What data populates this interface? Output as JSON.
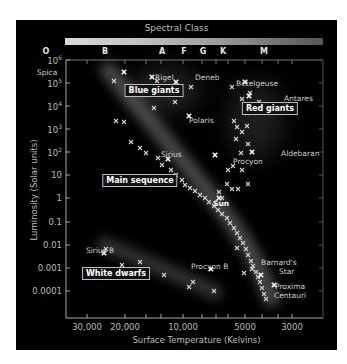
{
  "chart_data": {
    "type": "scatter",
    "title": "Spectral Class",
    "xlabel": "Surface Temperature (Kelvins)",
    "ylabel": "Luminosity (Solar units)",
    "x_scale": "log (reversed)",
    "y_scale": "log",
    "spectral_classes": [
      "O",
      "B",
      "A",
      "F",
      "G",
      "K",
      "M"
    ],
    "x_ticks": [
      "30,000",
      "20,000",
      "10,000",
      "5000",
      "3000"
    ],
    "y_ticks": [
      "10^6",
      "10^5",
      "10^4",
      "10^3",
      "10^2",
      "10",
      "1",
      "0.1",
      "0.01",
      "0.001",
      "0.0001"
    ],
    "regions": [
      "Blue giants",
      "Red giants",
      "Main sequence",
      "White dwarfs"
    ],
    "labeled_stars": [
      {
        "name": "Spica",
        "temp_K": 22000,
        "luminosity": 12000
      },
      {
        "name": "Rigel",
        "temp_K": 11000,
        "luminosity": 80000
      },
      {
        "name": "Deneb",
        "temp_K": 9000,
        "luminosity": 60000
      },
      {
        "name": "Polaris",
        "temp_K": 6500,
        "luminosity": 2000
      },
      {
        "name": "Betelgeuse",
        "temp_K": 3300,
        "luminosity": 100000
      },
      {
        "name": "Antares",
        "temp_K": 3100,
        "luminosity": 30000
      },
      {
        "name": "Aldebaran",
        "temp_K": 4000,
        "luminosity": 120
      },
      {
        "name": "Sirius",
        "temp_K": 10000,
        "luminosity": 25
      },
      {
        "name": "Procyon",
        "temp_K": 6500,
        "luminosity": 7
      },
      {
        "name": "Sun",
        "temp_K": 5800,
        "luminosity": 1
      },
      {
        "name": "Sirius B",
        "temp_K": 21000,
        "luminosity": 0.003
      },
      {
        "name": "Procyon B",
        "temp_K": 7500,
        "luminosity": 0.0006
      },
      {
        "name": "Barnard's Star",
        "temp_K": 3100,
        "luminosity": 0.0005
      },
      {
        "name": "Proxima Centauri",
        "temp_K": 2900,
        "luminosity": 0.0001
      }
    ],
    "grid": false,
    "legend": "none"
  },
  "header": {
    "title": "Spectral Class"
  },
  "axes": {
    "xlabel": "Surface Temperature (Kelvins)",
    "ylabel": "Luminosity (Solar units)",
    "y_ticks": [
      {
        "label": "10",
        "sup": "6",
        "y": 40
      },
      {
        "label": "10",
        "sup": "5",
        "y": 63
      },
      {
        "label": "10",
        "sup": "4",
        "y": 86
      },
      {
        "label": "10",
        "sup": "3",
        "y": 109
      },
      {
        "label": "10",
        "sup": "2",
        "y": 132
      },
      {
        "label": "10",
        "sup": "",
        "y": 155
      },
      {
        "label": "1",
        "sup": "",
        "y": 178
      },
      {
        "label": "0.1",
        "sup": "",
        "y": 202
      },
      {
        "label": "0.01",
        "sup": "",
        "y": 225
      },
      {
        "label": "0.001",
        "sup": "",
        "y": 248
      },
      {
        "label": "0.0001",
        "sup": "",
        "y": 271
      }
    ],
    "x_ticks": [
      {
        "label": "30,000",
        "x": 71
      },
      {
        "label": "20,000",
        "x": 109
      },
      {
        "label": "10,000",
        "x": 167
      },
      {
        "label": "5000",
        "x": 229
      },
      {
        "label": "3000",
        "x": 276
      }
    ]
  },
  "spectral": [
    {
      "label": "O",
      "x": 30
    },
    {
      "label": "B",
      "x": 89
    },
    {
      "label": "A",
      "x": 146
    },
    {
      "label": "F",
      "x": 168
    },
    {
      "label": "G",
      "x": 187
    },
    {
      "label": "K",
      "x": 207
    },
    {
      "label": "M",
      "x": 248
    }
  ],
  "regions": [
    {
      "label": "Blue giants",
      "x": 138,
      "y": 70
    },
    {
      "label": "Red giants",
      "x": 254,
      "y": 88
    },
    {
      "label": "Main sequence",
      "x": 124,
      "y": 160
    },
    {
      "label": "White dwarfs",
      "x": 100,
      "y": 253
    }
  ],
  "star_labels": [
    {
      "label": "Spica",
      "x": 21,
      "y": 52
    },
    {
      "label": "Rigel",
      "x": 139,
      "y": 57
    },
    {
      "label": "Deneb",
      "x": 179,
      "y": 57
    },
    {
      "label": "Polaris",
      "x": 173,
      "y": 100
    },
    {
      "label": "Betelgeuse",
      "x": 220,
      "y": 63
    },
    {
      "label": "Antares",
      "x": 268,
      "y": 78
    },
    {
      "label": "Aldebaran",
      "x": 265,
      "y": 133
    },
    {
      "label": "Sirius",
      "x": 145,
      "y": 134
    },
    {
      "label": "Procyon",
      "x": 217,
      "y": 141
    },
    {
      "label": "Sun",
      "x": 197,
      "y": 183,
      "bold": true
    },
    {
      "label": "Sirius B",
      "x": 70,
      "y": 230
    },
    {
      "label": "Procyon B",
      "x": 175,
      "y": 246
    },
    {
      "label": "Barnard's",
      "x": 245,
      "y": 242
    },
    {
      "label": "Star",
      "x": 263,
      "y": 251
    },
    {
      "label": "Proxima",
      "x": 259,
      "y": 266
    },
    {
      "label": "Centauri",
      "x": 258,
      "y": 275
    }
  ],
  "points": [
    [
      98,
      61
    ],
    [
      128,
      75
    ],
    [
      141,
      61
    ],
    [
      175,
      67
    ],
    [
      216,
      67
    ],
    [
      226,
      79
    ],
    [
      231,
      106
    ],
    [
      100,
      101
    ],
    [
      108,
      102
    ],
    [
      138,
      88
    ],
    [
      159,
      82
    ],
    [
      115,
      122
    ],
    [
      124,
      128
    ],
    [
      130,
      133
    ],
    [
      142,
      138
    ],
    [
      146,
      145
    ],
    [
      155,
      150
    ],
    [
      160,
      155
    ],
    [
      166,
      160
    ],
    [
      169,
      165
    ],
    [
      174,
      168
    ],
    [
      179,
      171
    ],
    [
      184,
      175
    ],
    [
      189,
      178
    ],
    [
      193,
      182
    ],
    [
      198,
      186
    ],
    [
      202,
      190
    ],
    [
      206,
      194
    ],
    [
      211,
      198
    ],
    [
      214,
      203
    ],
    [
      218,
      208
    ],
    [
      221,
      213
    ],
    [
      224,
      218
    ],
    [
      227,
      223
    ],
    [
      230,
      229
    ],
    [
      232,
      235
    ],
    [
      235,
      241
    ],
    [
      237,
      246
    ],
    [
      240,
      252
    ],
    [
      242,
      257
    ],
    [
      244,
      262
    ],
    [
      246,
      268
    ],
    [
      248,
      274
    ],
    [
      250,
      279
    ],
    [
      212,
      150
    ],
    [
      217,
      146
    ],
    [
      226,
      150
    ],
    [
      211,
      164
    ],
    [
      216,
      169
    ],
    [
      222,
      169
    ],
    [
      232,
      164
    ],
    [
      203,
      172
    ],
    [
      206,
      178
    ],
    [
      225,
      133
    ],
    [
      232,
      124
    ],
    [
      221,
      107
    ],
    [
      220,
      119
    ],
    [
      226,
      112
    ],
    [
      234,
      73
    ],
    [
      231,
      93
    ],
    [
      218,
      101
    ],
    [
      243,
      82
    ],
    [
      90,
      229
    ],
    [
      106,
      245
    ],
    [
      124,
      242
    ],
    [
      148,
      255
    ],
    [
      173,
      267
    ],
    [
      177,
      262
    ],
    [
      198,
      271
    ],
    [
      228,
      253
    ],
    [
      236,
      249
    ],
    [
      221,
      228
    ]
  ]
}
